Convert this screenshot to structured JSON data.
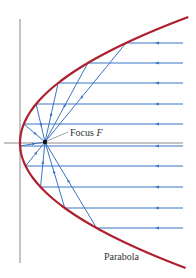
{
  "figure": {
    "labels": {
      "focus": "Focus ",
      "focus_var": "F",
      "curve": "Parabola"
    },
    "colors": {
      "parabola": "#b01f2e",
      "rays": "#3b74c4",
      "axes": "#6a6a6a",
      "focus_point": "#111111"
    },
    "geometry": {
      "vertex": [
        20,
        143
      ],
      "focus": [
        45,
        142
      ],
      "k": 0.0106,
      "y_range": [
        17,
        268
      ],
      "ray_right_x": 183,
      "arrow_x": 157,
      "ray_ys": [
        43,
        63,
        83,
        104,
        124,
        146,
        166,
        187,
        208,
        228
      ],
      "axes": {
        "vertical_x": 20,
        "vertical_y": [
          19,
          263
        ],
        "horizontal_y": 143,
        "horizontal_x": [
          4,
          183
        ]
      }
    }
  }
}
